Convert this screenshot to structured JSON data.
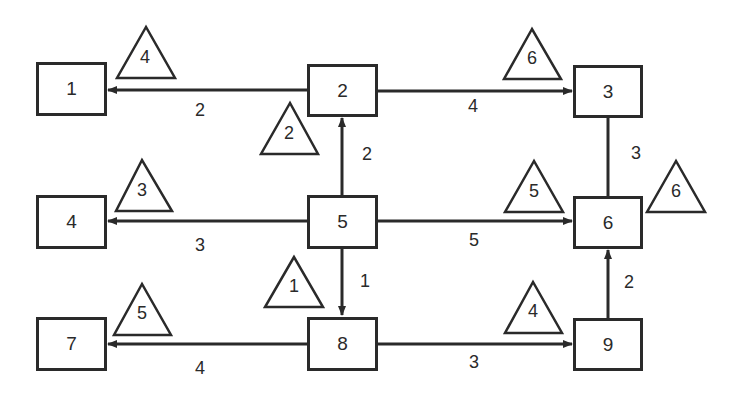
{
  "diagram": {
    "type": "network-graph",
    "colors": {
      "stroke": "#2a2a2a",
      "background": "#ffffff"
    },
    "nodes": [
      {
        "id": "1",
        "label": "1"
      },
      {
        "id": "2",
        "label": "2"
      },
      {
        "id": "3",
        "label": "3"
      },
      {
        "id": "4",
        "label": "4"
      },
      {
        "id": "5",
        "label": "5"
      },
      {
        "id": "6",
        "label": "6"
      },
      {
        "id": "7",
        "label": "7"
      },
      {
        "id": "8",
        "label": "8"
      },
      {
        "id": "9",
        "label": "9"
      }
    ],
    "edges": [
      {
        "from": "2",
        "to": "1",
        "weight": "2",
        "directed": true,
        "triangle": "4"
      },
      {
        "from": "2",
        "to": "3",
        "weight": "4",
        "directed": true,
        "triangle": "6"
      },
      {
        "from": "5",
        "to": "2",
        "weight": "2",
        "directed": true,
        "triangle": "2"
      },
      {
        "from": "3",
        "to": "6",
        "weight": "3",
        "directed": false,
        "triangle": "6"
      },
      {
        "from": "5",
        "to": "4",
        "weight": "3",
        "directed": true,
        "triangle": "3"
      },
      {
        "from": "5",
        "to": "6",
        "weight": "5",
        "directed": true,
        "triangle": "5"
      },
      {
        "from": "5",
        "to": "8",
        "weight": "1",
        "directed": true,
        "triangle": "1"
      },
      {
        "from": "8",
        "to": "7",
        "weight": "4",
        "directed": true,
        "triangle": "5"
      },
      {
        "from": "8",
        "to": "9",
        "weight": "3",
        "directed": true,
        "triangle": "4"
      },
      {
        "from": "9",
        "to": "6",
        "weight": "2",
        "directed": true,
        "triangle": null
      }
    ]
  }
}
